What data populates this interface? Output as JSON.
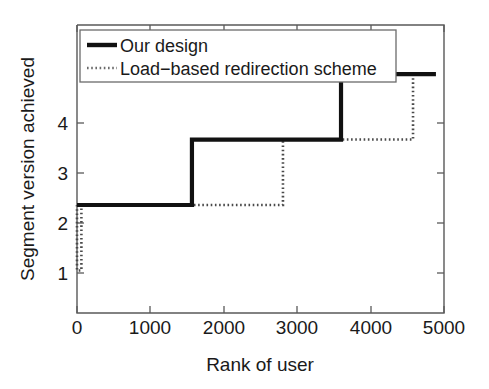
{
  "chart_data": {
    "type": "line",
    "title": "",
    "xlabel": "Rank of user",
    "ylabel": "Segment version achieved",
    "xlim": [
      0,
      5000
    ],
    "ylim": [
      0.35,
      4.75
    ],
    "xticks": [
      0,
      1000,
      2000,
      3000,
      4000,
      5000
    ],
    "xticklabels": [
      "0",
      "1000",
      "2000",
      "3000",
      "4000",
      "5000"
    ],
    "yticks": [
      1,
      2,
      3,
      4
    ],
    "yticklabels": [
      "1",
      "2",
      "3",
      "4"
    ],
    "grid": false,
    "legend_position": "upper-left",
    "series": [
      {
        "name": "Our design",
        "style": "solid",
        "color": "#111111",
        "points": [
          [
            0,
            2
          ],
          [
            1566,
            2
          ],
          [
            1566,
            3
          ],
          [
            3597,
            3
          ],
          [
            3597,
            4
          ],
          [
            4890,
            4
          ]
        ]
      },
      {
        "name": "Load−based redirection scheme",
        "style": "dotted",
        "color": "#4a4a4a",
        "points": [
          [
            0,
            2
          ],
          [
            0,
            1
          ],
          [
            60,
            1
          ],
          [
            60,
            2
          ],
          [
            1566,
            2
          ],
          [
            2806,
            2
          ],
          [
            2806,
            3
          ],
          [
            3597,
            3
          ],
          [
            4578,
            3
          ],
          [
            4578,
            4
          ],
          [
            4890,
            4
          ]
        ]
      }
    ]
  },
  "legend": {
    "entries": [
      {
        "label": "Our design",
        "style": "solid"
      },
      {
        "label": "Load−based redirection scheme",
        "style": "dotted"
      }
    ]
  },
  "axes": {
    "x_title": "Rank of user",
    "y_title": "Segment version achieved",
    "x_tick_0": "0",
    "x_tick_1": "1000",
    "x_tick_2": "2000",
    "x_tick_3": "3000",
    "x_tick_4": "4000",
    "x_tick_5": "5000",
    "y_tick_0": "1",
    "y_tick_1": "2",
    "y_tick_2": "3",
    "y_tick_3": "4"
  },
  "colors": {
    "background": "#ffffff",
    "axis": "#595959",
    "text": "#1a1a1a",
    "series_primary": "#111111",
    "series_secondary": "#4a4a4a"
  }
}
